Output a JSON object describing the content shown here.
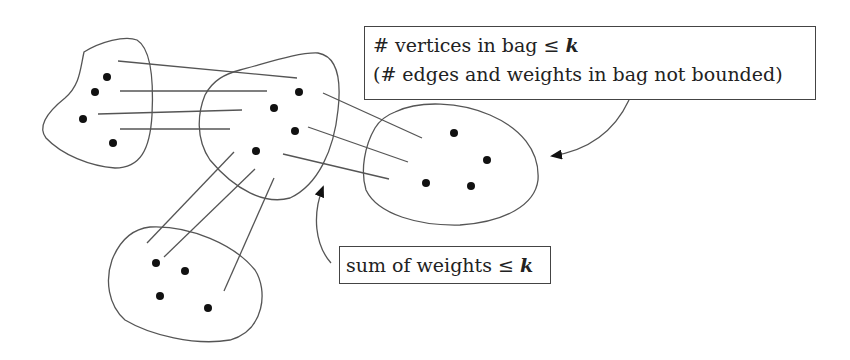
{
  "annotations": {
    "vertices_bound": {
      "line1_prefix": "# vertices in bag ≤ ",
      "line1_var": "k",
      "line2": "(# edges and weights in bag not bounded)"
    },
    "weights_bound": {
      "prefix": "sum of weights ≤ ",
      "var": "k"
    }
  },
  "diagram": {
    "stroke_color": "#555555",
    "dot_color": "#111111",
    "bags": [
      {
        "name": "left-bag",
        "vertices": [
          [
            107,
            77
          ],
          [
            95,
            92
          ],
          [
            83,
            119
          ],
          [
            113,
            143
          ]
        ]
      },
      {
        "name": "center-bag",
        "vertices": [
          [
            299,
            92
          ],
          [
            274,
            108
          ],
          [
            295,
            131
          ],
          [
            256,
            151
          ]
        ]
      },
      {
        "name": "right-bag",
        "vertices": [
          [
            454,
            133
          ],
          [
            487,
            160
          ],
          [
            426,
            183
          ],
          [
            471,
            186
          ]
        ]
      },
      {
        "name": "bottom-bag",
        "vertices": [
          [
            156,
            263
          ],
          [
            185,
            271
          ],
          [
            160,
            296
          ],
          [
            208,
            308
          ]
        ]
      }
    ]
  }
}
